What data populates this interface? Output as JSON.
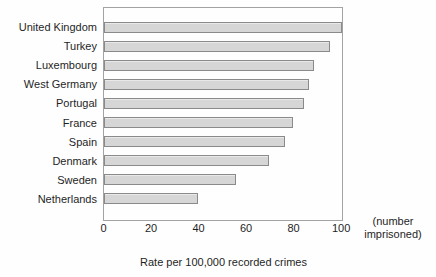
{
  "chart_data": {
    "type": "bar",
    "orientation": "horizontal",
    "categories": [
      "United Kingdom",
      "Turkey",
      "Luxembourg",
      "West Germany",
      "Portugal",
      "France",
      "Spain",
      "Denmark",
      "Sweden",
      "Netherlands"
    ],
    "values": [
      102,
      96,
      89,
      87,
      85,
      80,
      77,
      70,
      56,
      40
    ],
    "xlabel": "Rate per 100,000 recorded crimes",
    "unit_note": "(number imprisoned)",
    "xticks": [
      0,
      20,
      40,
      60,
      80,
      100
    ],
    "xlim": [
      0,
      101
    ],
    "grid": false,
    "legend_position": "none",
    "colors": {
      "bar_fill": "#d6d6d6",
      "bar_border": "#8a8a8a",
      "plot_border": "#a3a3a3",
      "text": "#1f1f1f",
      "background": "#fefefe"
    }
  }
}
